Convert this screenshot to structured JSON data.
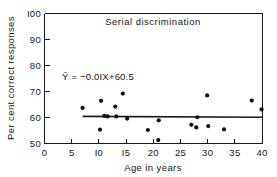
{
  "chart_data": {
    "type": "scatter",
    "title": "Serial  discrimination",
    "xlabel": "Age  in  years",
    "ylabel": "Per cent correct responses",
    "xlim": [
      0,
      40
    ],
    "ylim": [
      50,
      100
    ],
    "grid": false,
    "legend": "none",
    "xticks": [
      0,
      5,
      10,
      15,
      20,
      25,
      30,
      35,
      40
    ],
    "xticklabels": [
      "0",
      "5",
      "I0",
      "I5",
      "20",
      "25",
      "30",
      "35",
      "40"
    ],
    "yticks": [
      50,
      60,
      70,
      80,
      90,
      100
    ],
    "yticklabels": [
      "50",
      "60",
      "70",
      "80",
      "90",
      "I00"
    ],
    "annotation": "Ỹ = −0.0IX+60.5",
    "annotation_plain": "Y = -0.01X + 60.5",
    "fit_line": {
      "slope": -0.01,
      "intercept": 60.5,
      "x_start": 7,
      "x_end": 40
    },
    "points": [
      {
        "x": 7.0,
        "y": 63.7
      },
      {
        "x": 10.4,
        "y": 66.4
      },
      {
        "x": 11.0,
        "y": 60.6
      },
      {
        "x": 10.2,
        "y": 55.3
      },
      {
        "x": 11.6,
        "y": 60.4
      },
      {
        "x": 13.0,
        "y": 64.2
      },
      {
        "x": 13.2,
        "y": 60.4
      },
      {
        "x": 14.4,
        "y": 69.2
      },
      {
        "x": 15.2,
        "y": 59.6
      },
      {
        "x": 19.0,
        "y": 55.2
      },
      {
        "x": 20.9,
        "y": 51.3
      },
      {
        "x": 21.0,
        "y": 58.9
      },
      {
        "x": 27.0,
        "y": 57.2
      },
      {
        "x": 27.9,
        "y": 56.2
      },
      {
        "x": 28.1,
        "y": 60.1
      },
      {
        "x": 29.9,
        "y": 68.5
      },
      {
        "x": 30.1,
        "y": 56.7
      },
      {
        "x": 33.0,
        "y": 55.4
      },
      {
        "x": 38.1,
        "y": 66.5
      },
      {
        "x": 39.9,
        "y": 63.1
      }
    ]
  }
}
